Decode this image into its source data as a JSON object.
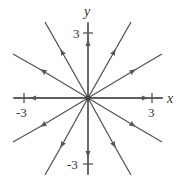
{
  "diagram": {
    "type": "phase-portrait",
    "axes": {
      "x_label": "x",
      "y_label": "y",
      "x_ticks": [
        "-3",
        "3"
      ],
      "y_ticks": [
        "3",
        "-3"
      ]
    },
    "line_color": "#555555",
    "trajectories": [
      {
        "direction": "right",
        "slope": "0"
      },
      {
        "direction": "left",
        "slope": "0"
      },
      {
        "direction": "up",
        "slope": "vertical"
      },
      {
        "direction": "down",
        "slope": "vertical"
      },
      {
        "direction": "upper-right-steep"
      },
      {
        "direction": "upper-right-shallow"
      },
      {
        "direction": "upper-left-steep"
      },
      {
        "direction": "upper-left-shallow"
      },
      {
        "direction": "lower-right-steep"
      },
      {
        "direction": "lower-right-shallow"
      },
      {
        "direction": "lower-left-steep"
      },
      {
        "direction": "lower-left-shallow"
      }
    ],
    "equilibrium": {
      "x": 0,
      "y": 0,
      "kind": "unstable star node"
    }
  }
}
